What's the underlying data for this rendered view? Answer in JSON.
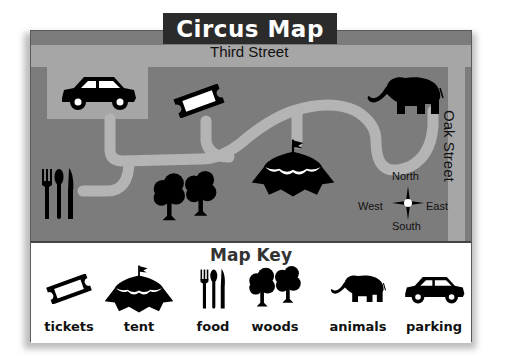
{
  "title": "Circus Map",
  "streets": {
    "top": "Third Street",
    "right": "Oak Street"
  },
  "compass": {
    "north": "North",
    "south": "South",
    "east": "East",
    "west": "West"
  },
  "map_places": [
    {
      "name": "parking",
      "icon": "car-icon"
    },
    {
      "name": "tickets",
      "icon": "ticket-icon"
    },
    {
      "name": "animals",
      "icon": "elephant-icon"
    },
    {
      "name": "tent",
      "icon": "tent-icon"
    },
    {
      "name": "woods",
      "icon": "trees-icon"
    },
    {
      "name": "food",
      "icon": "utensils-icon"
    }
  ],
  "key": {
    "title": "Map Key",
    "items": [
      {
        "label": "tickets",
        "icon": "ticket-icon"
      },
      {
        "label": "tent",
        "icon": "tent-icon"
      },
      {
        "label": "food",
        "icon": "utensils-icon"
      },
      {
        "label": "woods",
        "icon": "trees-icon"
      },
      {
        "label": "animals",
        "icon": "elephant-icon"
      },
      {
        "label": "parking",
        "icon": "car-icon"
      }
    ]
  },
  "colors": {
    "map_background": "#7c7c7c",
    "street": "#a6a6a6",
    "path": "#b4b4b4",
    "title_banner": "#2b2b2b",
    "icon": "#000000"
  }
}
